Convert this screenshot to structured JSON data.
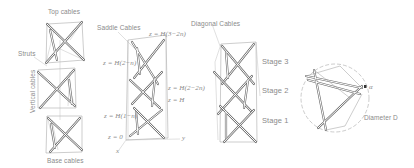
{
  "figure": {
    "panels": [
      {
        "id": "module-assembly",
        "labels": {
          "top": "Top cables",
          "struts": "Struts",
          "vertical": "Vertical cables",
          "base": "Base cables"
        }
      },
      {
        "id": "stacked-heights",
        "labels": {
          "saddle": "Saddle Cables",
          "z_top": "z = H(3−2n)",
          "z_2n": "z = H(2−n)",
          "z_2_2n": "z = H(2−2n)",
          "z_h": "z = H",
          "z_1n": "z = H(1−n)",
          "z_0": "z = 0",
          "axis_y": "y",
          "axis_x": "x"
        }
      },
      {
        "id": "three-stage-tower",
        "labels": {
          "diagonal": "Diagonal Cables",
          "stage3": "Stage 3",
          "stage2": "Stage 2",
          "stage1": "Stage 1"
        }
      },
      {
        "id": "top-view",
        "labels": {
          "angle": "α",
          "diameter": "Diameter D"
        }
      }
    ]
  }
}
